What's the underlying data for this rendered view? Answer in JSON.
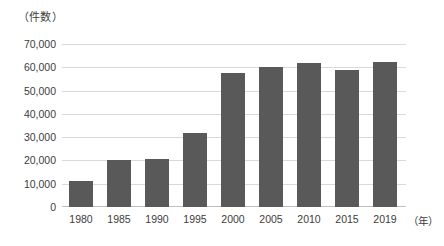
{
  "chart_data": {
    "type": "bar",
    "title": "",
    "subtitle": "",
    "xlabel": "（年）",
    "ylabel": "（件数）",
    "categories": [
      "1980",
      "1985",
      "1990",
      "1995",
      "2000",
      "2005",
      "2010",
      "2015",
      "2019"
    ],
    "values": [
      11000,
      20000,
      20500,
      32000,
      57500,
      60000,
      61800,
      58800,
      62200
    ],
    "series": [
      {
        "name": "件数",
        "values": [
          11000,
          20000,
          20500,
          32000,
          57500,
          60000,
          61800,
          58800,
          62200
        ]
      }
    ],
    "ylim": [
      0,
      70000
    ],
    "y_ticks": [
      70000,
      60000,
      50000,
      40000,
      30000,
      20000,
      10000,
      0
    ],
    "y_tick_labels": [
      "70,000",
      "60,000",
      "50,000",
      "40,000",
      "30,000",
      "20,000",
      "10,000",
      "0"
    ],
    "grid": true,
    "legend": false,
    "legend_position": "none",
    "bar_color": "#595959",
    "gridline_color": "#d9d9d9",
    "axis_color": "#bfbfbf",
    "text_color": "#3b3b3b",
    "background_color": "#ffffff"
  }
}
